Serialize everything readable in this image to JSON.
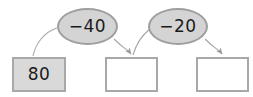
{
  "diagram": {
    "type": "arrow-flow-chain",
    "background_color": "#ffffff",
    "box_fill_filled": "#d9d9d9",
    "box_fill_empty": "#ffffff",
    "box_border_color": "#a8a8a8",
    "ellipse_fill": "#d4d4d4",
    "ellipse_border_color": "#9e9e9e",
    "arrow_color": "#a0a0a0",
    "text_color": "#1a1a1a"
  },
  "boxes": [
    {
      "id": "box-1",
      "value": "80",
      "filled": true
    },
    {
      "id": "box-2",
      "value": "",
      "filled": false
    },
    {
      "id": "box-3",
      "value": "",
      "filled": false
    }
  ],
  "operations": [
    {
      "id": "ellipse-1",
      "label": "−40"
    },
    {
      "id": "ellipse-2",
      "label": "−20"
    }
  ],
  "arrows": [
    {
      "id": "arrow-1",
      "from": "box-1",
      "to": "ellipse-1",
      "arrowhead": false
    },
    {
      "id": "arrow-2",
      "from": "ellipse-1",
      "to": "box-2",
      "arrowhead": true
    },
    {
      "id": "arrow-3",
      "from": "ellipse-2",
      "to": "box-3",
      "arrowhead": true
    }
  ]
}
